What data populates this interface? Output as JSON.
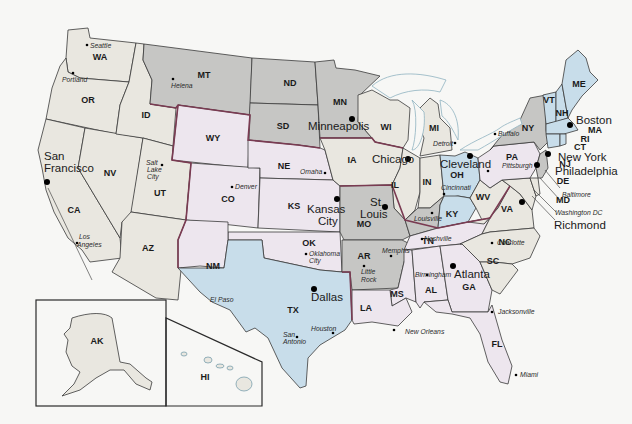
{
  "colors": {
    "west": "#e9e7e0",
    "north_central": "#c6c6c4",
    "plains": "#ede6ee",
    "south_central": "#c8ddea",
    "east_central": "#c6c6c4",
    "northeast": "#c8ddea",
    "southeast": "#ede6ee",
    "lakes": "#f7f7f5",
    "region_border": "#7a3b52"
  },
  "states": [
    {
      "abbr": "WA",
      "region": "west"
    },
    {
      "abbr": "OR",
      "region": "west"
    },
    {
      "abbr": "CA",
      "region": "west"
    },
    {
      "abbr": "NV",
      "region": "west"
    },
    {
      "abbr": "ID",
      "region": "west"
    },
    {
      "abbr": "UT",
      "region": "west"
    },
    {
      "abbr": "AZ",
      "region": "west"
    },
    {
      "abbr": "AK",
      "region": "west"
    },
    {
      "abbr": "HI",
      "region": "west"
    },
    {
      "abbr": "MT",
      "region": "north_central"
    },
    {
      "abbr": "ND",
      "region": "north_central"
    },
    {
      "abbr": "SD",
      "region": "north_central"
    },
    {
      "abbr": "MN",
      "region": "north_central"
    },
    {
      "abbr": "WY",
      "region": "plains"
    },
    {
      "abbr": "CO",
      "region": "plains"
    },
    {
      "abbr": "NE",
      "region": "plains"
    },
    {
      "abbr": "KS",
      "region": "plains"
    },
    {
      "abbr": "OK",
      "region": "plains"
    },
    {
      "abbr": "NM",
      "region": "plains"
    },
    {
      "abbr": "TX",
      "region": "south_central"
    },
    {
      "abbr": "WI",
      "region": "west"
    },
    {
      "abbr": "MI",
      "region": "west"
    },
    {
      "abbr": "IA",
      "region": "west"
    },
    {
      "abbr": "IL",
      "region": "west"
    },
    {
      "abbr": "IN",
      "region": "west"
    },
    {
      "abbr": "MO",
      "region": "east_central"
    },
    {
      "abbr": "AR",
      "region": "east_central"
    },
    {
      "abbr": "KY",
      "region": "south_central"
    },
    {
      "abbr": "OH",
      "region": "south_central"
    },
    {
      "abbr": "TN",
      "region": "southeast"
    },
    {
      "abbr": "MS",
      "region": "southeast"
    },
    {
      "abbr": "AL",
      "region": "southeast"
    },
    {
      "abbr": "GA",
      "region": "southeast"
    },
    {
      "abbr": "FL",
      "region": "southeast"
    },
    {
      "abbr": "LA",
      "region": "southeast"
    },
    {
      "abbr": "SC",
      "region": "west"
    },
    {
      "abbr": "NC",
      "region": "west"
    },
    {
      "abbr": "VA",
      "region": "west"
    },
    {
      "abbr": "WV",
      "region": "west"
    },
    {
      "abbr": "PA",
      "region": "southeast"
    },
    {
      "abbr": "NY",
      "region": "north_central"
    },
    {
      "abbr": "VT",
      "region": "northeast"
    },
    {
      "abbr": "NH",
      "region": "northeast"
    },
    {
      "abbr": "ME",
      "region": "northeast"
    },
    {
      "abbr": "MA",
      "region": "northeast"
    },
    {
      "abbr": "RI",
      "region": "northeast"
    },
    {
      "abbr": "CT",
      "region": "northeast"
    },
    {
      "abbr": "NJ",
      "region": "southeast"
    },
    {
      "abbr": "DE",
      "region": "west"
    },
    {
      "abbr": "MD",
      "region": "west"
    }
  ],
  "major_cities": [
    "San Francisco",
    "Minneapolis",
    "Chicago",
    "Kansas City",
    "St. Louis",
    "Dallas",
    "Atlanta",
    "Cleveland",
    "New York",
    "Boston",
    "Philadelphia",
    "Richmond"
  ],
  "minor_cities": [
    "Seattle",
    "Portland",
    "Helena",
    "Salt Lake City",
    "Los Angeles",
    "Denver",
    "Omaha",
    "Oklahoma City",
    "Little Rock",
    "Memphis",
    "Nashville",
    "Louisville",
    "Cincinnati",
    "Detroit",
    "Buffalo",
    "Pittsburgh",
    "Baltimore",
    "Washington DC",
    "Charlotte",
    "Birmingham",
    "Jacksonville",
    "Miami",
    "New Orleans",
    "El Paso",
    "San Antonio",
    "Houston"
  ],
  "labels": {
    "san_francisco_1": "San",
    "san_francisco_2": "Francisco",
    "kansas_city_1": "Kansas",
    "kansas_city_2": "City",
    "st_louis_1": "St.",
    "st_louis_2": "Louis",
    "salt_lake_1": "Salt",
    "salt_lake_2": "Lake",
    "salt_lake_3": "City",
    "los_angeles_1": "Los",
    "los_angeles_2": "Angeles",
    "oklahoma_city_1": "Oklahoma",
    "oklahoma_city_2": "City",
    "little_rock_1": "Little",
    "little_rock_2": "Rock",
    "san_antonio_1": "San",
    "san_antonio_2": "Antonio"
  }
}
